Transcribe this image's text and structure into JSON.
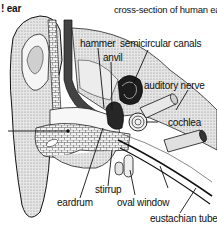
{
  "diagram": {
    "corner_title": "! ear",
    "title": "cross-section of human ear",
    "labels": {
      "hammer": "hammer",
      "anvil": "anvil",
      "semicircular_canals": "semicircular canals",
      "auditory_nerve": "auditory nerve",
      "cochlea": "cochlea",
      "stirrup": "stirrup",
      "eardrum": "eardrum",
      "oval_window": "oval window",
      "eustachian_tube": "eustachian tube"
    },
    "colors": {
      "ink": "#111111",
      "shade_dark": "#2a2a2a",
      "shade_mid": "#8a8a8a",
      "shade_light": "#d4d4d4",
      "paper": "#ffffff"
    }
  }
}
